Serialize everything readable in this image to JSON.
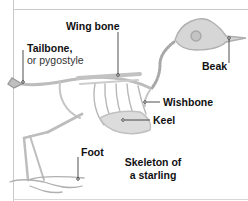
{
  "figure": {
    "caption_line1": "Skeleton of",
    "caption_line2": "a starling",
    "labels": {
      "wing_bone": "Wing bone",
      "tailbone": "Tailbone,",
      "tailbone_alt": "or pygostyle",
      "beak": "Beak",
      "wishbone": "Wishbone",
      "keel": "Keel",
      "foot": "Foot"
    },
    "colors": {
      "bone": "#c8c8c8",
      "bone_dark": "#9a9a9a",
      "leader_line": "#222222",
      "frame": "#c9c9c9"
    }
  }
}
